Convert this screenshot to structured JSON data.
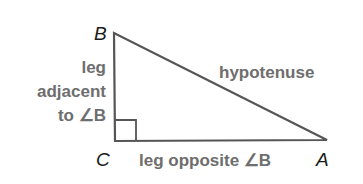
{
  "diagram": {
    "type": "right-triangle",
    "vertices": {
      "B": {
        "label": "B",
        "x": 114,
        "y": 33
      },
      "C": {
        "label": "C",
        "x": 115,
        "y": 141
      },
      "A": {
        "label": "A",
        "x": 327,
        "y": 140
      }
    },
    "right_angle_at": "C",
    "sides": {
      "hypotenuse": {
        "label": "hypotenuse"
      },
      "adjacent": {
        "lines": [
          "leg",
          "adjacent",
          "to ∠B"
        ]
      },
      "opposite": {
        "label": "leg opposite ∠B"
      }
    },
    "colors": {
      "line": "#555555",
      "side_text": "#6e6e6e",
      "vertex_text": "#1a1a1a"
    }
  }
}
